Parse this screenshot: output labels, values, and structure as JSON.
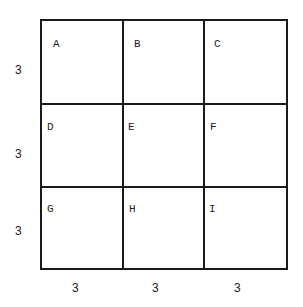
{
  "diagram": {
    "cells": [
      "A",
      "B",
      "C",
      "D",
      "E",
      "F",
      "G",
      "H",
      "I"
    ],
    "row_dimensions": [
      "3",
      "3",
      "3"
    ],
    "column_dimensions": [
      "3",
      "3",
      "3"
    ]
  }
}
